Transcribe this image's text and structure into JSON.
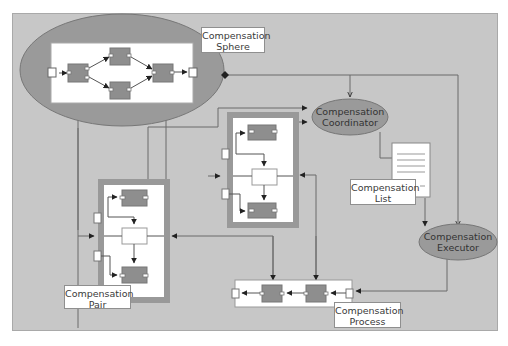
{
  "diagram": {
    "colors": {
      "frame_bg": "#c7c7c7",
      "ellipse_fill": "#9a9a9a",
      "component_fill": "#8e8e8e",
      "container_border": "#999999",
      "line": "#5a5a5a",
      "label_bg": "#ffffff"
    },
    "nodes": {
      "compensation_sphere": {
        "label": "Compensation\nSphere",
        "shape": "ellipse-with-process"
      },
      "compensation_coordinator": {
        "label": "Compensation\nCoordinator",
        "shape": "ellipse"
      },
      "compensation_list": {
        "label": "Compensation\nList",
        "shape": "document"
      },
      "compensation_executor": {
        "label": "Compensation\nExecutor",
        "shape": "ellipse"
      },
      "compensation_pair_front": {
        "shape": "pair-container"
      },
      "compensation_pair": {
        "label": "Compensation\nPair",
        "shape": "pair-container"
      },
      "compensation_process": {
        "label": "Compensation\nProcess",
        "shape": "process-chain"
      }
    },
    "edges": [
      {
        "from": "compensation_sphere",
        "to": "compensation_coordinator",
        "style": "diamond-start, open-arrow"
      },
      {
        "from": "compensation_sphere",
        "to": "compensation_executor",
        "style": "open-arrow"
      },
      {
        "from": "compensation_pair",
        "to": "compensation_coordinator",
        "style": "filled-arrow"
      },
      {
        "from": "compensation_pair_front",
        "to": "compensation_coordinator",
        "style": "filled-arrow"
      },
      {
        "from": "compensation_coordinator",
        "to": "compensation_list",
        "style": "line"
      },
      {
        "from": "compensation_list",
        "to": "compensation_executor",
        "style": "filled-arrow"
      },
      {
        "from": "compensation_executor",
        "to": "compensation_process",
        "style": "filled-arrow"
      },
      {
        "from": "compensation_process",
        "to": "compensation_pair",
        "style": "filled-arrow"
      },
      {
        "from": "compensation_process",
        "to": "compensation_pair_front",
        "style": "filled-arrow"
      },
      {
        "from": "compensation_pair",
        "to": "compensation_sphere",
        "style": "filled-arrow"
      },
      {
        "from": "compensation_pair_front",
        "to": "compensation_sphere",
        "style": "filled-arrow"
      }
    ]
  }
}
